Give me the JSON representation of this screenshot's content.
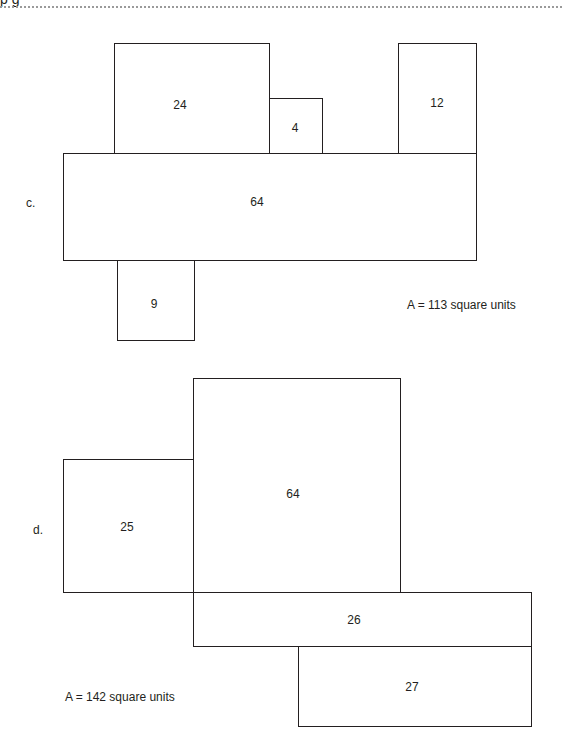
{
  "header": {
    "fragment_text": "p  g"
  },
  "part_c": {
    "label": "c.",
    "area_text": "A = 113 square units",
    "rectangles": [
      {
        "id": "c-24",
        "value": "24",
        "x": 114,
        "y": 43,
        "w": 155,
        "h": 110
      },
      {
        "id": "c-4",
        "value": "4",
        "x": 269,
        "y": 98,
        "w": 53,
        "h": 55
      },
      {
        "id": "c-12",
        "value": "12",
        "x": 398,
        "y": 43,
        "w": 78,
        "h": 110
      },
      {
        "id": "c-64",
        "value": "64",
        "x": 63,
        "y": 153,
        "w": 414,
        "h": 108
      },
      {
        "id": "c-9",
        "value": "9",
        "x": 117,
        "y": 260,
        "w": 77,
        "h": 81
      }
    ]
  },
  "part_d": {
    "label": "d.",
    "area_text": "A = 142 square units",
    "rectangles": [
      {
        "id": "d-25",
        "value": "25",
        "x": 63,
        "y": 459,
        "w": 131,
        "h": 134
      },
      {
        "id": "d-64",
        "value": "64",
        "x": 193,
        "y": 378,
        "w": 208,
        "h": 215
      },
      {
        "id": "d-26",
        "value": "26",
        "x": 193,
        "y": 592,
        "w": 339,
        "h": 55
      },
      {
        "id": "d-27",
        "value": "27",
        "x": 298,
        "y": 646,
        "w": 234,
        "h": 81
      }
    ]
  }
}
